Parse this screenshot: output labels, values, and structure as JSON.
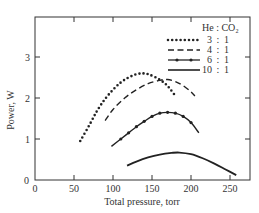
{
  "chart_data": {
    "type": "line",
    "title": "",
    "xlabel": "Total pressure, torr",
    "ylabel": "Power, W",
    "xlim": [
      0,
      260
    ],
    "ylim": [
      0,
      4
    ],
    "xticks": [
      0,
      50,
      100,
      150,
      200,
      250
    ],
    "yticks": [
      0,
      1,
      2,
      3
    ],
    "grid": false,
    "legend": {
      "position": "upper right",
      "header": {
        "left": "He",
        "sep": ":",
        "right": "CO₂"
      },
      "entries": [
        {
          "style": "dotted",
          "ratio_he": "3",
          "ratio_co2": "1"
        },
        {
          "style": "dashed",
          "ratio_he": "4",
          "ratio_co2": "1"
        },
        {
          "style": "dash-dot",
          "ratio_he": "6",
          "ratio_co2": "1"
        },
        {
          "style": "solid",
          "ratio_he": "10",
          "ratio_co2": "1"
        }
      ]
    },
    "series": [
      {
        "name": "3 : 1",
        "style": "dotted",
        "x": [
          58,
          70,
          80,
          90,
          100,
          110,
          120,
          130,
          138,
          145,
          155,
          165,
          172,
          180
        ],
        "y": [
          0.95,
          1.35,
          1.7,
          1.98,
          2.2,
          2.38,
          2.5,
          2.58,
          2.6,
          2.58,
          2.5,
          2.38,
          2.25,
          2.05
        ]
      },
      {
        "name": "4 : 1",
        "style": "dashed",
        "x": [
          90,
          100,
          115,
          130,
          145,
          160,
          170,
          180,
          190,
          200,
          205
        ],
        "y": [
          1.45,
          1.72,
          2.0,
          2.2,
          2.35,
          2.43,
          2.45,
          2.4,
          2.3,
          2.15,
          2.05
        ]
      },
      {
        "name": "6 : 1",
        "style": "dash-dot",
        "x": [
          98,
          110,
          120,
          130,
          140,
          150,
          160,
          170,
          180,
          190,
          200,
          210
        ],
        "y": [
          0.82,
          1.0,
          1.15,
          1.3,
          1.43,
          1.55,
          1.63,
          1.65,
          1.63,
          1.55,
          1.4,
          1.15
        ]
      },
      {
        "name": "10 : 1",
        "style": "solid",
        "x": [
          118,
          130,
          145,
          160,
          175,
          185,
          200,
          215,
          230,
          245,
          258
        ],
        "y": [
          0.35,
          0.45,
          0.55,
          0.62,
          0.66,
          0.67,
          0.63,
          0.53,
          0.4,
          0.25,
          0.12
        ]
      }
    ]
  }
}
